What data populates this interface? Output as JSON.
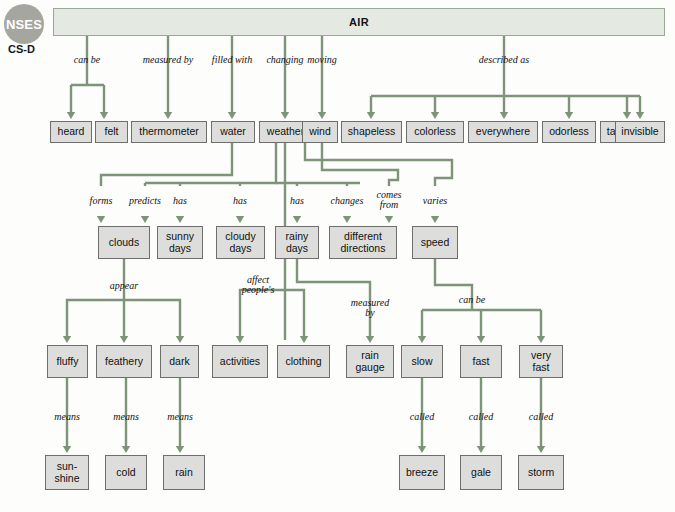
{
  "badge": {
    "name": "NSES",
    "code": "CS-D"
  },
  "root": {
    "label": "AIR",
    "x": 53,
    "y": 8,
    "w": 612,
    "h": 28
  },
  "colors": {
    "connector": "#7d9478",
    "node_fill": "#dddedb",
    "node_border": "#6e6f6c",
    "root_fill": "#e4e9e2",
    "root_border": "#9aa89a",
    "badge_fill": "#a6a6a0",
    "text": "#101013"
  },
  "nodes": [
    {
      "id": "heard",
      "label": "heard",
      "x": 50,
      "y": 121,
      "w": 42,
      "h": 22
    },
    {
      "id": "felt",
      "label": "felt",
      "x": 95,
      "y": 121,
      "w": 33,
      "h": 22
    },
    {
      "id": "thermometer",
      "label": "thermometer",
      "x": 131,
      "y": 121,
      "w": 76,
      "h": 22
    },
    {
      "id": "water",
      "label": "water",
      "x": 211,
      "y": 121,
      "w": 44,
      "h": 22
    },
    {
      "id": "weather",
      "label": "weather",
      "x": 259,
      "y": 121,
      "w": 53,
      "h": 22
    },
    {
      "id": "wind",
      "label": "wind",
      "x": 302,
      "y": 121,
      "w": 36,
      "h": 22
    },
    {
      "id": "shapeless",
      "label": "shapeless",
      "x": 341,
      "y": 121,
      "w": 61,
      "h": 22
    },
    {
      "id": "colorless",
      "label": "colorless",
      "x": 406,
      "y": 121,
      "w": 58,
      "h": 22
    },
    {
      "id": "everywhere",
      "label": "everywhere",
      "x": 468,
      "y": 121,
      "w": 70,
      "h": 22
    },
    {
      "id": "odorless",
      "label": "odorless",
      "x": 542,
      "y": 121,
      "w": 54,
      "h": 22
    },
    {
      "id": "tasteless",
      "label": "tasteless",
      "x": 600,
      "y": 121,
      "w": 55,
      "h": 22
    },
    {
      "id": "invisible",
      "label": "invisible",
      "x": 615,
      "y": 121,
      "w": 50,
      "h": 22
    },
    {
      "id": "clouds",
      "label": "clouds",
      "x": 98,
      "y": 226,
      "w": 52,
      "h": 33
    },
    {
      "id": "sunnydays",
      "label": "sunny\ndays",
      "x": 157,
      "y": 226,
      "w": 46,
      "h": 33
    },
    {
      "id": "cloudydays",
      "label": "cloudy\ndays",
      "x": 216,
      "y": 226,
      "w": 49,
      "h": 33
    },
    {
      "id": "rainydays",
      "label": "rainy\ndays",
      "x": 275,
      "y": 226,
      "w": 44,
      "h": 33
    },
    {
      "id": "diffdir",
      "label": "different\ndirections",
      "x": 329,
      "y": 226,
      "w": 68,
      "h": 33
    },
    {
      "id": "speed",
      "label": "speed",
      "x": 412,
      "y": 226,
      "w": 46,
      "h": 33
    },
    {
      "id": "fluffy",
      "label": "fluffy",
      "x": 47,
      "y": 345,
      "w": 41,
      "h": 33
    },
    {
      "id": "feathery",
      "label": "feathery",
      "x": 96,
      "y": 345,
      "w": 56,
      "h": 33
    },
    {
      "id": "dark",
      "label": "dark",
      "x": 160,
      "y": 345,
      "w": 39,
      "h": 33
    },
    {
      "id": "activities",
      "label": "activities",
      "x": 212,
      "y": 345,
      "w": 56,
      "h": 33
    },
    {
      "id": "clothing",
      "label": "clothing",
      "x": 277,
      "y": 345,
      "w": 53,
      "h": 33
    },
    {
      "id": "raingauge",
      "label": "rain\ngauge",
      "x": 346,
      "y": 345,
      "w": 48,
      "h": 33
    },
    {
      "id": "slow",
      "label": "slow",
      "x": 401,
      "y": 345,
      "w": 42,
      "h": 33
    },
    {
      "id": "fast",
      "label": "fast",
      "x": 460,
      "y": 345,
      "w": 42,
      "h": 33
    },
    {
      "id": "veryfast",
      "label": "very\nfast",
      "x": 519,
      "y": 345,
      "w": 44,
      "h": 33
    },
    {
      "id": "sunshine",
      "label": "sun-\nshine",
      "x": 45,
      "y": 455,
      "w": 44,
      "h": 35
    },
    {
      "id": "cold",
      "label": "cold",
      "x": 105,
      "y": 455,
      "w": 42,
      "h": 35
    },
    {
      "id": "rain",
      "label": "rain",
      "x": 163,
      "y": 455,
      "w": 42,
      "h": 35
    },
    {
      "id": "breeze",
      "label": "breeze",
      "x": 399,
      "y": 455,
      "w": 46,
      "h": 35
    },
    {
      "id": "gale",
      "label": "gale",
      "x": 460,
      "y": 455,
      "w": 42,
      "h": 35
    },
    {
      "id": "storm",
      "label": "storm",
      "x": 518,
      "y": 455,
      "w": 46,
      "h": 35
    }
  ],
  "edge_labels": [
    {
      "id": "can-be-1",
      "text": "can be",
      "x": 87,
      "y": 55
    },
    {
      "id": "measured-by-1",
      "text": "measured by",
      "x": 168,
      "y": 55
    },
    {
      "id": "filled-with",
      "text": "filled with",
      "x": 232,
      "y": 55
    },
    {
      "id": "changing",
      "text": "changing",
      "x": 285,
      "y": 55
    },
    {
      "id": "moving",
      "text": "moving",
      "x": 322,
      "y": 55
    },
    {
      "id": "described-as",
      "text": "described as",
      "x": 504,
      "y": 55
    },
    {
      "id": "forms",
      "text": "forms",
      "x": 101,
      "y": 196
    },
    {
      "id": "predicts",
      "text": "predicts",
      "x": 145,
      "y": 196
    },
    {
      "id": "has-1",
      "text": "has",
      "x": 180,
      "y": 196
    },
    {
      "id": "has-2",
      "text": "has",
      "x": 240,
      "y": 196
    },
    {
      "id": "has-3",
      "text": "has",
      "x": 297,
      "y": 196
    },
    {
      "id": "changes",
      "text": "changes",
      "x": 347,
      "y": 196
    },
    {
      "id": "comes-from",
      "text": "comes\nfrom",
      "x": 389,
      "y": 190
    },
    {
      "id": "varies",
      "text": "varies",
      "x": 435,
      "y": 196
    },
    {
      "id": "appear",
      "text": "appear",
      "x": 124,
      "y": 281
    },
    {
      "id": "affect",
      "text": "affect\npeople's",
      "x": 258,
      "y": 275
    },
    {
      "id": "measured-by-2",
      "text": "measured\nby",
      "x": 370,
      "y": 298
    },
    {
      "id": "can-be-2",
      "text": "can be",
      "x": 472,
      "y": 295
    },
    {
      "id": "means-1",
      "text": "means",
      "x": 67,
      "y": 412
    },
    {
      "id": "means-2",
      "text": "means",
      "x": 126,
      "y": 412
    },
    {
      "id": "means-3",
      "text": "means",
      "x": 180,
      "y": 412
    },
    {
      "id": "called-1",
      "text": "called",
      "x": 422,
      "y": 412
    },
    {
      "id": "called-2",
      "text": "called",
      "x": 481,
      "y": 412
    },
    {
      "id": "called-3",
      "text": "called",
      "x": 541,
      "y": 412
    }
  ],
  "connectors": {
    "description": "polyline paths in SVG user units matching the 675x512 canvas",
    "paths": [
      "M 87,36 L 87,85",
      "M 71,85 L 104,85",
      "M 71,85 L 71,112",
      "M 104,85 L 104,112",
      "M 168,36 L 168,112",
      "M 232,36 L 232,112",
      "M 285,36 L 285,112",
      "M 322,36 L 322,112",
      "M 504,36 L 504,96",
      "M 371,96 L 640,96",
      "M 371,96 L 371,112",
      "M 435,96 L 435,112",
      "M 504,96 L 504,112",
      "M 569,96 L 569,112",
      "M 627,96 L 627,112",
      "M 640,96 L 640,112",
      "M 232,143 L 232,175 L 101,175 L 101,186",
      "M 276,143 L 276,183 L 145,183",
      "M 145,183 L 145,186",
      "M 276,183 L 360,183",
      "M 180,183 L 180,186",
      "M 240,183 L 240,186",
      "M 297,183 L 297,186",
      "M 347,183 L 347,186",
      "M 285,143 L 285,340",
      "M 322,143 L 322,170 L 398,170 L 398,180 L 389,180 L 389,186",
      "M 305,143 L 305,160 L 452,160 L 452,178 L 435,178 L 435,186",
      "M 124,259 L 124,300 L 67,300 L 67,338",
      "M 124,300 L 180,300 L 180,338",
      "M 124,300 L 124,338",
      "M 258,290 L 240,290 L 240,338",
      "M 258,290 L 304,290 L 304,338",
      "M 297,259 L 297,282 L 370,282 L 370,338",
      "M 435,259 L 435,285 L 472,285 L 472,310",
      "M 422,310 L 541,310",
      "M 422,310 L 422,338",
      "M 481,310 L 481,338",
      "M 541,310 L 541,338",
      "M 67,378 L 67,448",
      "M 126,378 L 126,448",
      "M 180,378 L 180,448",
      "M 422,378 L 422,448",
      "M 481,378 L 481,448",
      "M 541,378 L 541,448"
    ]
  }
}
